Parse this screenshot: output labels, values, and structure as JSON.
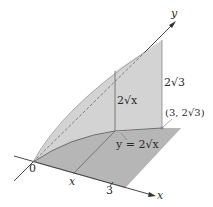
{
  "diagram": {
    "type": "3d-solid-cross-section",
    "axes": {
      "x_label": "x",
      "y_label": "y",
      "origin_label": "0"
    },
    "ticks": {
      "x_variable_label": "x",
      "x_end_label": "3"
    },
    "labels": {
      "height_at_x": "2√x",
      "height_at_3": "2√3",
      "point": "(3, 2√3)",
      "curve": "y = 2√x"
    },
    "colors": {
      "base_region": "#bdbdbd",
      "vertical_surface": "#c9c9c9",
      "cross_section": "#d6d6d6",
      "axis": "#333333",
      "curve": "#6e6e6e"
    }
  }
}
